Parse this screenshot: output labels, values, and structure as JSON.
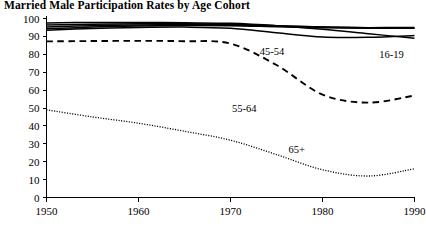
{
  "chart_data": {
    "type": "line",
    "title": "Married Male Participation Rates by Age Cohort",
    "xlabel": "",
    "ylabel": "",
    "xlim": [
      1950,
      1990
    ],
    "ylim": [
      0,
      100
    ],
    "xticks": [
      1950,
      1960,
      1970,
      1980,
      1990
    ],
    "yticks": [
      0,
      10,
      20,
      30,
      40,
      50,
      60,
      70,
      80,
      90,
      100
    ],
    "grid": false,
    "legend": "inline-labels",
    "x": [
      1950,
      1955,
      1960,
      1965,
      1970,
      1975,
      1980,
      1985,
      1990
    ],
    "series": [
      {
        "name": "16-19",
        "label": "16-19",
        "style": "solid",
        "label_x": 1987.5,
        "label_y": 78,
        "values": [
          97.5,
          97.8,
          97.8,
          97.6,
          97.3,
          96.0,
          94.0,
          91.5,
          89.0
        ]
      },
      {
        "name": "20-24",
        "label": "",
        "style": "solid",
        "values": [
          96.3,
          96.8,
          97.0,
          97.1,
          96.8,
          96.0,
          95.3,
          94.8,
          94.5
        ]
      },
      {
        "name": "25-34",
        "label": "",
        "style": "solid",
        "values": [
          95.3,
          96.0,
          96.4,
          96.6,
          96.4,
          95.8,
          95.2,
          94.9,
          95.0
        ]
      },
      {
        "name": "35-44",
        "label": "",
        "style": "solid",
        "values": [
          94.3,
          95.2,
          95.8,
          96.1,
          96.0,
          95.4,
          94.8,
          94.6,
          94.7
        ]
      },
      {
        "name": "45-54",
        "label": "45-54",
        "style": "solid",
        "label_x": 1974.5,
        "label_y": 79.5,
        "values": [
          93.5,
          94.4,
          95.0,
          95.2,
          94.6,
          92.0,
          89.6,
          89.5,
          90.5
        ]
      },
      {
        "name": "55-64",
        "label": "55-64",
        "style": "dashed",
        "label_x": 1971.5,
        "label_y": 48,
        "values": [
          87.2,
          87.4,
          87.5,
          87.3,
          86.0,
          74.0,
          57.5,
          53.0,
          57.0
        ]
      },
      {
        "name": "65+",
        "label": "65+",
        "style": "dotted",
        "label_x": 1977.2,
        "label_y": 25,
        "values": [
          49.0,
          45.0,
          41.5,
          37.0,
          32.0,
          24.0,
          15.5,
          12.0,
          16.0
        ]
      }
    ]
  }
}
